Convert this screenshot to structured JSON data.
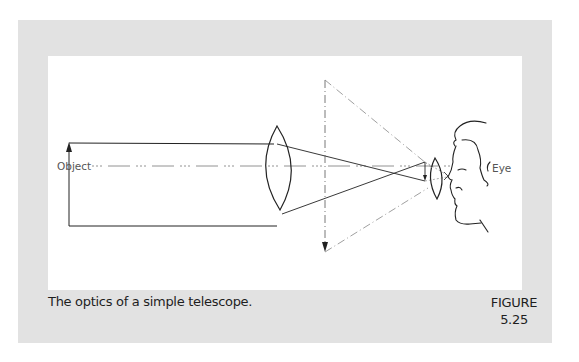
{
  "figure": {
    "caption": "The optics of a simple telescope.",
    "label_line1": "FIGURE",
    "label_line2": "5.25"
  },
  "diagram": {
    "labels": {
      "object": "Object",
      "eye": "Eye"
    },
    "elements": [
      "object-arrow",
      "parallel-rays",
      "objective-lens",
      "optical-axis",
      "converging-rays",
      "intermediate-image-arrow",
      "eyepiece-lens",
      "virtual-image-arrow",
      "virtual-image-construction-lines",
      "observer-head"
    ],
    "colors": {
      "frame": "#e2e2e2",
      "panel": "#ffffff",
      "line": "#222222",
      "dashed": "#777777"
    }
  }
}
